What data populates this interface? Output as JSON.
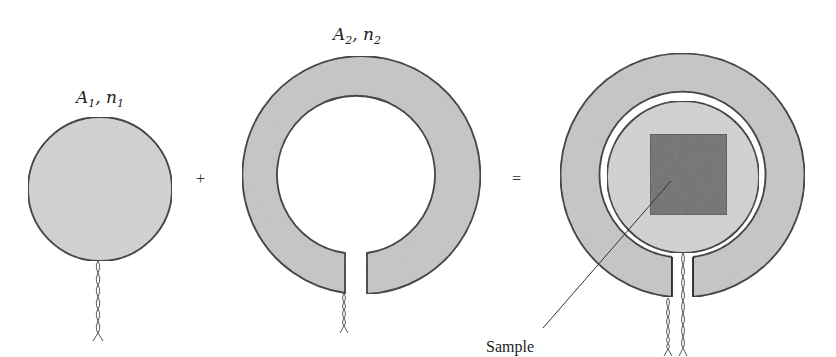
{
  "figure": {
    "part1": {
      "label_main": "A",
      "label_sub": "1",
      "label_sep": ", ",
      "label_var": "n",
      "label_var_sub": "1",
      "shape": "filled-disk",
      "fill_color": "#d2d2d2"
    },
    "operator_plus": "+",
    "part2": {
      "label_main": "A",
      "label_sub": "2",
      "label_sep": ", ",
      "label_var": "n",
      "label_var_sub": "2",
      "shape": "split-ring",
      "fill_color": "#c4c4c4"
    },
    "operator_equals": "=",
    "result": {
      "shape": "disk-inside-split-ring",
      "sample_label": "Sample",
      "sample_color": "#6e6e6e",
      "disk_color": "#d2d2d2",
      "ring_color": "#c4c4c4"
    }
  }
}
